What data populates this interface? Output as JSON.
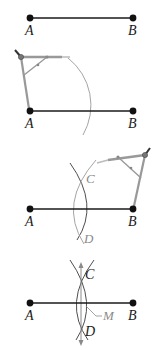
{
  "diagram": {
    "colors": {
      "segment": "#1a1a1a",
      "arc_dark": "#3a3a3a",
      "arc_light": "#9a9a9a",
      "compass": "#9c9c9c",
      "compass_dark": "#555555"
    },
    "steps": [
      {
        "step": 1,
        "points": [
          {
            "label": "A",
            "x": 30,
            "y": 18
          },
          {
            "label": "B",
            "x": 133,
            "y": 18
          }
        ]
      },
      {
        "step": 2,
        "points": [
          {
            "label": "A",
            "x": 30,
            "y": 111
          },
          {
            "label": "B",
            "x": 133,
            "y": 111
          }
        ],
        "compass_at": "A"
      },
      {
        "step": 3,
        "points": [
          {
            "label": "A",
            "x": 30,
            "y": 209
          },
          {
            "label": "B",
            "x": 133,
            "y": 209
          }
        ],
        "intersections": [
          {
            "label": "C",
            "x": 82,
            "y": 178
          },
          {
            "label": "D",
            "x": 80,
            "y": 237
          }
        ],
        "compass_at": "B"
      },
      {
        "step": 4,
        "points": [
          {
            "label": "A",
            "x": 30,
            "y": 303
          },
          {
            "label": "B",
            "x": 133,
            "y": 303
          }
        ],
        "intersections": [
          {
            "label": "C",
            "x": 82,
            "y": 276
          },
          {
            "label": "D",
            "x": 82,
            "y": 330
          }
        ],
        "midpoint": {
          "label": "M",
          "x": 81,
          "y": 303
        }
      }
    ]
  },
  "labels": {
    "s1_a": "A",
    "s1_b": "B",
    "s2_a": "A",
    "s2_b": "B",
    "s3_a": "A",
    "s3_b": "B",
    "s3_c": "C",
    "s3_d": "D",
    "s4_a": "A",
    "s4_b": "B",
    "s4_c": "C",
    "s4_d": "D",
    "s4_m": "M"
  }
}
